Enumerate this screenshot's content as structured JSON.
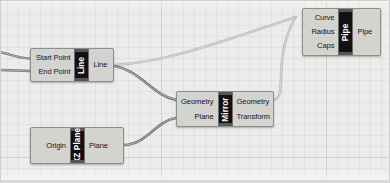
{
  "app": {
    "name": "Grasshopper Canvas",
    "canvas_background": "#ececeb",
    "grid_color": "#afafac",
    "node_body_color": "#d3d3d0",
    "node_title_color": "#111111",
    "wire_color": "#6e6e6e"
  },
  "nodes": [
    {
      "id": "line",
      "title": "Line",
      "inputs": [
        "Start Point",
        "End Point"
      ],
      "outputs": [
        "Line"
      ]
    },
    {
      "id": "xz-plane",
      "title": "XZ Plane",
      "inputs": [
        "Origin"
      ],
      "outputs": [
        "Plane"
      ]
    },
    {
      "id": "mirror",
      "title": "Mirror",
      "inputs": [
        "Geometry",
        "Plane"
      ],
      "outputs": [
        "Geometry",
        "Transform"
      ]
    },
    {
      "id": "pipe",
      "title": "Pipe",
      "inputs": [
        "Curve",
        "Radius",
        "Caps"
      ],
      "outputs": [
        "Pipe"
      ]
    }
  ]
}
